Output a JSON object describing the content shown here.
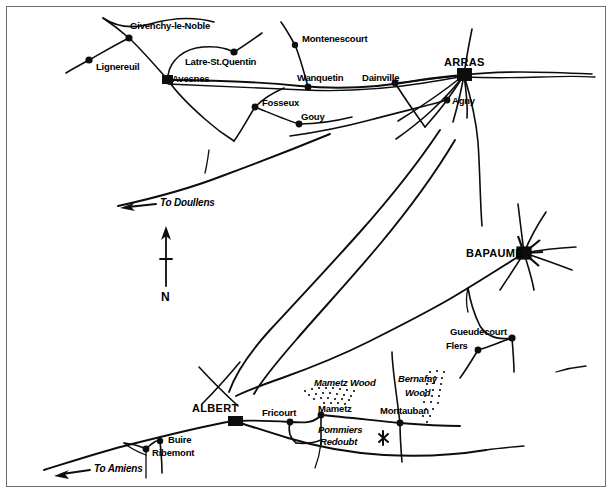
{
  "map": {
    "title": "Arras - Albert - Bapaume area map",
    "frame_color": "#6d6d6d",
    "ink_color": "#0d0d0d",
    "background": "#ffffff",
    "compass": {
      "label": "N",
      "name": "north-arrow"
    },
    "direction_labels": [
      {
        "text": "To Doullens",
        "x": 160,
        "y": 198
      },
      {
        "text": "To Amiens",
        "x": 94,
        "y": 467
      }
    ],
    "villages": [
      {
        "name": "Givenchy-le-Noble",
        "label": "Givenchy-le-Noble",
        "x": 129,
        "y": 38,
        "lx": 130,
        "ly": 21,
        "marker": "dot"
      },
      {
        "name": "Lignereuil",
        "label": "Lignereuil",
        "x": 89,
        "y": 60,
        "lx": 96,
        "ly": 62,
        "marker": "dot"
      },
      {
        "name": "Latre-St.Quentin",
        "label": "Latre-St.Quentin",
        "x": 234,
        "y": 52,
        "lx": 185,
        "ly": 57,
        "marker": "dot"
      },
      {
        "name": "Avesnes",
        "label": "Avesnes",
        "x": 168,
        "y": 80,
        "lx": 172,
        "ly": 74,
        "marker": "square"
      },
      {
        "name": "Montenescourt",
        "label": "Montenescourt",
        "x": 295,
        "y": 45,
        "lx": 302,
        "ly": 34,
        "marker": "dot"
      },
      {
        "name": "Wanquetin",
        "label": "Wanquetin",
        "x": 308,
        "y": 87,
        "lx": 297,
        "ly": 73,
        "marker": "dot"
      },
      {
        "name": "Dainville",
        "label": "Dainville",
        "x": 395,
        "y": 83,
        "lx": 362,
        "ly": 73,
        "marker": "dot"
      },
      {
        "name": "Arras",
        "label": "ARRAS",
        "x": 464,
        "y": 75,
        "lx": 444,
        "ly": 59,
        "marker": "hub"
      },
      {
        "name": "Agny",
        "label": "Agny",
        "x": 447,
        "y": 100,
        "lx": 452,
        "ly": 97,
        "marker": "dot"
      },
      {
        "name": "Fosseux",
        "label": "Fosseux",
        "x": 255,
        "y": 107,
        "lx": 262,
        "ly": 99,
        "marker": "dot"
      },
      {
        "name": "Gouy",
        "label": "Gouy",
        "x": 299,
        "y": 124,
        "lx": 301,
        "ly": 113,
        "marker": "dot"
      },
      {
        "name": "Bapaume",
        "label": "BAPAUME",
        "x": 524,
        "y": 253,
        "lx": 466,
        "ly": 248,
        "marker": "hub"
      },
      {
        "name": "Gueudecourt",
        "label": "Gueudecourt",
        "x": 512,
        "y": 338,
        "lx": 450,
        "ly": 327,
        "marker": "dot"
      },
      {
        "name": "Flers",
        "label": "Flers",
        "x": 478,
        "y": 350,
        "lx": 446,
        "ly": 341,
        "marker": "dot"
      },
      {
        "name": "Albert",
        "label": "ALBERT",
        "x": 234,
        "y": 421,
        "lx": 192,
        "ly": 404,
        "marker": "square"
      },
      {
        "name": "Fricourt",
        "label": "Fricourt",
        "x": 290,
        "y": 422,
        "lx": 262,
        "ly": 408,
        "marker": "dot"
      },
      {
        "name": "Mametz",
        "label": "Mametz",
        "x": 321,
        "y": 415,
        "lx": 320,
        "ly": 404,
        "marker": "dot"
      },
      {
        "name": "Montauban",
        "label": "Montauban",
        "x": 400,
        "y": 423,
        "lx": 380,
        "ly": 406,
        "marker": "dot"
      },
      {
        "name": "Buire",
        "label": "Buire",
        "x": 160,
        "y": 441,
        "lx": 168,
        "ly": 436,
        "marker": "dot"
      },
      {
        "name": "Ribemont",
        "label": "Ribemont",
        "x": 146,
        "y": 449,
        "lx": 152,
        "ly": 448,
        "marker": "dot"
      }
    ],
    "woods": [
      {
        "name": "Mametz Wood",
        "label": "Mametz Wood",
        "lx": 314,
        "ly": 379
      },
      {
        "name": "Bernafay Wood",
        "label_line1": "Bernafay",
        "label_line2": "Wood",
        "lx": 398,
        "ly": 375,
        "lx2": 404,
        "ly2": 389
      }
    ],
    "positions": [
      {
        "name": "Pommiers Redoubt",
        "label_line1": "Pommiers",
        "label_line2": "Redoubt",
        "lx": 318,
        "ly": 425,
        "lx2": 320,
        "ly2": 437,
        "marker": "x-cross"
      }
    ]
  }
}
